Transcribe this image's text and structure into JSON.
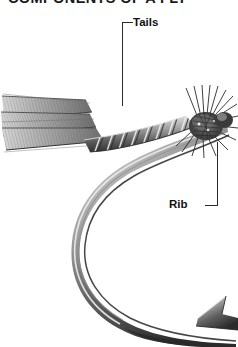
{
  "figure": {
    "title": "COMPONENTS OF A FLY",
    "background_color": "#ffffff",
    "ink_color": "#2b2b2b",
    "width_px": 238,
    "height_px": 347
  },
  "callouts": [
    {
      "id": "tails",
      "label": "Tails",
      "label_x": 133,
      "label_y": 16,
      "leader": {
        "elbow_x": 122,
        "elbow_y": 22,
        "drop_to_y": 106
      },
      "points_to": "tail fibers extending left from the hook bend"
    },
    {
      "id": "rib",
      "label": "Rib",
      "label_x": 169,
      "label_y": 198,
      "leader": {
        "elbow_x": 217,
        "elbow_y": 205,
        "riser_from_y": 142
      },
      "points_to": "ribbing wire wound over the fly body"
    }
  ],
  "parts": [
    {
      "name": "tails",
      "description": "long striated fibers fanning left"
    },
    {
      "name": "body",
      "description": "tapered dubbed body along the hook shank"
    },
    {
      "name": "rib",
      "description": "spiral wire wrap over the body"
    },
    {
      "name": "hackle",
      "description": "spiky fiber collar behind the head"
    },
    {
      "name": "head",
      "description": "thread head at the hook eye"
    },
    {
      "name": "hook-bend",
      "description": "sweeping curve of the hook"
    },
    {
      "name": "hook-point",
      "description": "sharpened tip of the hook"
    },
    {
      "name": "hook-barb",
      "description": "backward facing barb near the point"
    }
  ],
  "palette": {
    "paper": "#ffffff",
    "steel_light": "#d8d8d8",
    "steel_mid": "#8f8f8f",
    "steel_dark": "#3a3a3a",
    "fiber_light": "#c9c9c9",
    "fiber_dark": "#5a5a5a",
    "label_text": "#111111"
  }
}
